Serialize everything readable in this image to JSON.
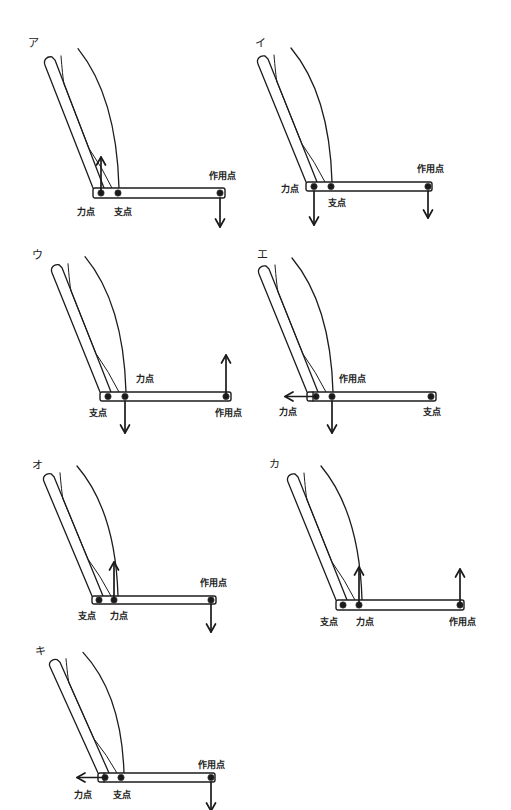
{
  "figures": [
    {
      "label": "ア",
      "points": [
        {
          "role": "effort",
          "label": "力点",
          "arrow": "up"
        },
        {
          "role": "fulcrum",
          "label": "支点",
          "arrow": null
        },
        {
          "role": "load",
          "label": "作用点",
          "arrow": "down"
        }
      ]
    },
    {
      "label": "イ",
      "points": [
        {
          "role": "effort",
          "label": "力点",
          "arrow": "down"
        },
        {
          "role": "fulcrum",
          "label": "支点",
          "arrow": null
        },
        {
          "role": "load",
          "label": "作用点",
          "arrow": "down"
        }
      ]
    },
    {
      "label": "ウ",
      "points": [
        {
          "role": "fulcrum",
          "label": "支点",
          "arrow": null
        },
        {
          "role": "effort",
          "label": "力点",
          "arrow": "down"
        },
        {
          "role": "load",
          "label": "作用点",
          "arrow": "up"
        }
      ]
    },
    {
      "label": "エ",
      "points": [
        {
          "role": "effort",
          "label": "力点",
          "arrow": "left"
        },
        {
          "role": "load",
          "label": "作用点",
          "arrow": "down"
        },
        {
          "role": "fulcrum",
          "label": "支点",
          "arrow": null
        }
      ]
    },
    {
      "label": "オ",
      "points": [
        {
          "role": "fulcrum",
          "label": "支点",
          "arrow": null
        },
        {
          "role": "effort",
          "label": "力点",
          "arrow": "up"
        },
        {
          "role": "load",
          "label": "作用点",
          "arrow": "down"
        }
      ]
    },
    {
      "label": "カ",
      "points": [
        {
          "role": "fulcrum",
          "label": "支点",
          "arrow": null
        },
        {
          "role": "effort",
          "label": "力点",
          "arrow": "up"
        },
        {
          "role": "load",
          "label": "作用点",
          "arrow": "up"
        }
      ]
    },
    {
      "label": "キ",
      "points": [
        {
          "role": "effort",
          "label": "力点",
          "arrow": "left"
        },
        {
          "role": "fulcrum",
          "label": "支点",
          "arrow": null
        },
        {
          "role": "load",
          "label": "作用点",
          "arrow": "down"
        }
      ]
    }
  ]
}
